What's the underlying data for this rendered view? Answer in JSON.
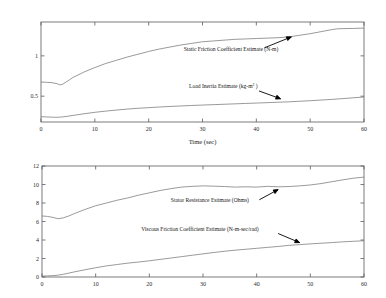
{
  "figure": {
    "background": "#ffffff",
    "line_color": "#6e6e6e",
    "axis_color": "#5a5a5a",
    "text_color": "#141414"
  },
  "chart_data": [
    {
      "type": "line",
      "title": "",
      "xlabel": "Time (sec)",
      "ylabel": "",
      "xlim": [
        0,
        60
      ],
      "ylim": [
        0.18,
        1.42
      ],
      "xticks": [
        0,
        10,
        20,
        30,
        40,
        50,
        60
      ],
      "xticklabels": [
        "0",
        "10",
        "20",
        "30",
        "40",
        "50",
        "60"
      ],
      "yticks": [
        0.5,
        1
      ],
      "yticklabels": [
        "0.5",
        "1"
      ],
      "grid": false,
      "legend": "annotations",
      "series": [
        {
          "name": "Static Friction Coefficient Estimate (N-m)",
          "units": "N-m",
          "x": [
            0,
            1,
            2,
            3,
            3.5,
            4,
            5,
            6,
            8,
            10,
            12,
            14,
            16,
            18,
            20,
            22,
            24,
            26,
            28,
            30,
            32,
            34,
            36,
            38,
            40,
            42,
            44,
            46,
            48,
            50,
            52,
            54,
            55,
            56,
            58,
            60
          ],
          "values": [
            0.675,
            0.672,
            0.668,
            0.655,
            0.64,
            0.648,
            0.69,
            0.735,
            0.8,
            0.855,
            0.905,
            0.945,
            0.985,
            1.02,
            1.055,
            1.085,
            1.11,
            1.135,
            1.155,
            1.175,
            1.185,
            1.195,
            1.205,
            1.21,
            1.215,
            1.22,
            1.225,
            1.235,
            1.255,
            1.275,
            1.3,
            1.325,
            1.335,
            1.338,
            1.34,
            1.345
          ]
        },
        {
          "name": "Load Inertia Estimate (kg-m²)",
          "units": "kg-m2",
          "x": [
            0,
            1,
            2,
            3,
            4,
            5,
            6,
            8,
            10,
            12,
            14,
            16,
            18,
            20,
            22,
            24,
            26,
            28,
            30,
            32,
            34,
            36,
            38,
            40,
            42,
            44,
            46,
            48,
            50,
            52,
            54,
            56,
            58,
            60
          ],
          "values": [
            0.245,
            0.243,
            0.24,
            0.238,
            0.243,
            0.252,
            0.262,
            0.282,
            0.3,
            0.315,
            0.328,
            0.34,
            0.35,
            0.358,
            0.366,
            0.373,
            0.379,
            0.385,
            0.39,
            0.395,
            0.4,
            0.405,
            0.41,
            0.415,
            0.42,
            0.425,
            0.43,
            0.437,
            0.444,
            0.452,
            0.46,
            0.47,
            0.48,
            0.49
          ]
        }
      ],
      "annotations": [
        {
          "text": "Static Friction Coefficient Estimate (N-m)",
          "label_x": 26.5,
          "label_y": 1.055,
          "arrow_from_x": 41.5,
          "arrow_from_y": 1.1,
          "arrow_to_x": 46.5,
          "arrow_to_y": 1.235
        },
        {
          "text": "Load Inertia Estimate (kg-m",
          "superscript": "2",
          "text_tail": " )",
          "label_x": 27.5,
          "label_y": 0.6,
          "arrow_from_x": 40.5,
          "arrow_from_y": 0.565,
          "arrow_to_x": 44.5,
          "arrow_to_y": 0.468
        }
      ]
    },
    {
      "type": "line",
      "title": "",
      "xlabel": "",
      "ylabel": "",
      "xlim": [
        0,
        60
      ],
      "ylim": [
        0,
        12
      ],
      "xticks": [
        0,
        10,
        20,
        30,
        40,
        50,
        60
      ],
      "xticklabels": [
        "0",
        "10",
        "20",
        "30",
        "40",
        "50",
        "60"
      ],
      "yticks": [
        0,
        2,
        4,
        6,
        8,
        10,
        12
      ],
      "yticklabels": [
        "0",
        "2",
        "4",
        "6",
        "8",
        "10",
        "12"
      ],
      "grid": false,
      "legend": "annotations",
      "series": [
        {
          "name": "Stator Resistance Estimate (Ohms)",
          "units": "Ohms",
          "x": [
            0,
            1,
            2,
            3,
            4,
            5,
            6,
            8,
            10,
            12,
            14,
            16,
            18,
            20,
            22,
            24,
            26,
            28,
            30,
            32,
            34,
            36,
            38,
            40,
            42,
            44,
            46,
            48,
            50,
            52,
            54,
            56,
            58,
            60
          ],
          "values": [
            6.6,
            6.55,
            6.45,
            6.3,
            6.4,
            6.6,
            6.85,
            7.3,
            7.7,
            8.0,
            8.3,
            8.55,
            8.85,
            9.1,
            9.35,
            9.55,
            9.72,
            9.8,
            9.85,
            9.82,
            9.78,
            9.72,
            9.75,
            9.72,
            9.8,
            9.75,
            9.78,
            9.85,
            9.95,
            10.1,
            10.3,
            10.5,
            10.68,
            10.8
          ]
        },
        {
          "name": "Viscous Friction Coefficient Estimate (N-m-sec/rad)",
          "units": "N-m-sec/rad",
          "x": [
            0,
            1,
            2,
            3,
            4,
            5,
            6,
            8,
            10,
            12,
            14,
            16,
            18,
            20,
            22,
            24,
            26,
            28,
            30,
            32,
            34,
            36,
            38,
            40,
            42,
            44,
            46,
            48,
            50,
            52,
            54,
            56,
            58,
            60
          ],
          "values": [
            0.1,
            0.12,
            0.15,
            0.2,
            0.3,
            0.42,
            0.55,
            0.78,
            1.0,
            1.2,
            1.35,
            1.5,
            1.62,
            1.75,
            1.9,
            2.05,
            2.2,
            2.35,
            2.5,
            2.65,
            2.78,
            2.9,
            3.0,
            3.1,
            3.2,
            3.3,
            3.42,
            3.5,
            3.58,
            3.65,
            3.72,
            3.8,
            3.86,
            3.92
          ]
        }
      ],
      "annotations": [
        {
          "text": "Stator Resistance Estimate (Ohms)",
          "label_x": 24.0,
          "label_y": 8.15,
          "arrow_from_x": 40.5,
          "arrow_from_y": 8.35,
          "arrow_to_x": 44.0,
          "arrow_to_y": 9.45
        },
        {
          "text": "Viscous Friction Coefficient Estimate (N-m-sec/rad)",
          "label_x": 18.5,
          "label_y": 4.95,
          "arrow_from_x": 44.0,
          "arrow_from_y": 4.7,
          "arrow_to_x": 48.0,
          "arrow_to_y": 3.72
        }
      ]
    }
  ]
}
